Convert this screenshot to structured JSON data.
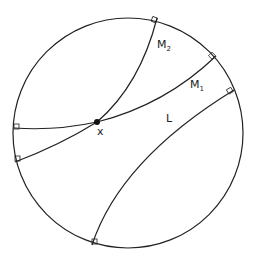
{
  "diagram": {
    "labels": {
      "M2": {
        "main": "M",
        "sub": "2"
      },
      "M1": {
        "main": "M",
        "sub": "1"
      },
      "L": "L",
      "x": "x"
    },
    "colors": {
      "stroke": "#222222",
      "background": "#ffffff"
    }
  }
}
